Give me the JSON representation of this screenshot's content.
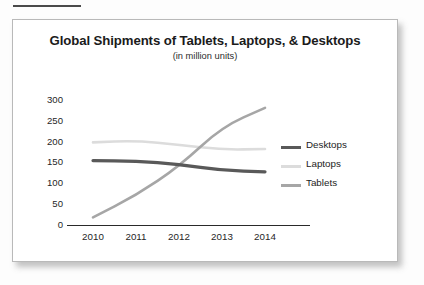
{
  "page": {
    "background_color": "#fdfdfd",
    "card_border_color": "#b9b9b9",
    "top_rule_color": "#4a4a4a"
  },
  "chart_data": {
    "type": "line",
    "title": "Global Shipments of Tablets, Laptops, & Desktops",
    "subtitle": "(in million units)",
    "xlabel": "",
    "ylabel": "",
    "categories": [
      "2010",
      "2011",
      "2012",
      "2013",
      "2014"
    ],
    "ylim": [
      0,
      300
    ],
    "yticks": [
      0,
      50,
      100,
      150,
      200,
      250,
      300
    ],
    "ytick_labels": [
      "0",
      "50",
      "100",
      "150",
      "200",
      "250",
      "300"
    ],
    "grid": false,
    "legend_position": "right",
    "series": [
      {
        "name": "Desktops",
        "color": "#595959",
        "width": 3.2,
        "values": [
          154,
          153,
          145,
          130,
          127
        ]
      },
      {
        "name": "Laptops",
        "color": "#dcdcdc",
        "width": 2.6,
        "values": [
          198,
          202,
          192,
          180,
          182
        ]
      },
      {
        "name": "Tablets",
        "color": "#a6a6a6",
        "width": 2.6,
        "values": [
          17,
          70,
          140,
          235,
          281
        ]
      }
    ]
  }
}
